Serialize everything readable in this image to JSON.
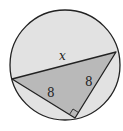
{
  "diagram": {
    "type": "inscribed-right-triangle",
    "labels": {
      "hypotenuse": "x",
      "leg_left": "8",
      "leg_right": "8"
    },
    "right_angle_marker": true,
    "colors": {
      "circle_fill": "#e2e2e2",
      "triangle_fill": "#b9b9b9",
      "stroke": "#222222",
      "background": "#ffffff"
    }
  }
}
